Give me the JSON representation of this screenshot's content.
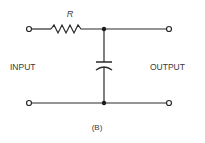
{
  "diagram": {
    "type": "RC low-pass filter schematic",
    "caption": "(B)",
    "components": {
      "resistor": {
        "label": "R"
      },
      "capacitor": {
        "label": ""
      }
    },
    "labels": {
      "input": "INPUT",
      "output": "OUTPUT"
    },
    "colors": {
      "stroke": "#2a2a2a",
      "text": "#3a3a3a",
      "background": "#ffffff"
    }
  }
}
